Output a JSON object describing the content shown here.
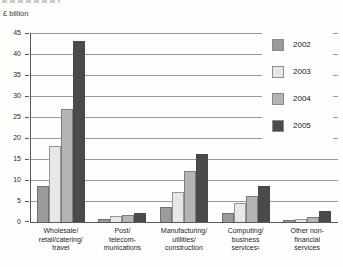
{
  "header": {
    "unit_label": "£ billion"
  },
  "chart_data": {
    "type": "bar",
    "title": "",
    "ylabel": "£ billion",
    "xlabel": "",
    "ylim": [
      0,
      45
    ],
    "ytick_interval": 5,
    "grid": true,
    "legend_position": "top-right-overlay",
    "categories": [
      "Wholesale/\nretail/catering/\ntravel",
      "Post/\ntelecom-\nmunications",
      "Manufacturing/\nutilities/\nconstruction",
      "Computing/\nbusiness\nservices¹",
      "Other non-\nfinancial\nservices"
    ],
    "series": [
      {
        "name": "2002",
        "color": "#9b9b9b",
        "values": [
          8.5,
          0.7,
          3.6,
          2.1,
          0.4
        ]
      },
      {
        "name": "2003",
        "color": "#e7e7e4",
        "values": [
          18.1,
          1.4,
          7.2,
          4.6,
          0.8
        ]
      },
      {
        "name": "2004",
        "color": "#b4b4b4",
        "values": [
          27.0,
          1.7,
          12.2,
          6.3,
          1.3
        ]
      },
      {
        "name": "2005",
        "color": "#4a4a4a",
        "values": [
          43.0,
          2.2,
          16.1,
          8.6,
          2.6
        ]
      }
    ],
    "axis_color": "#5a5a5a",
    "grid_color": "#9a9a9a"
  }
}
